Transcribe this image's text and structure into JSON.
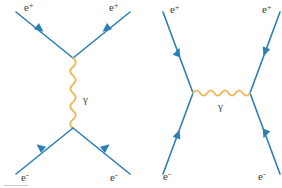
{
  "figure": {
    "background_color": "#ffffff",
    "width": 282,
    "height": 188
  },
  "colors": {
    "fermion_line": "#2b7fb8",
    "photon_line": "#edb95a",
    "label_text": "#3b3b3b",
    "frame_line": "#c9c9c9"
  },
  "diagrams": [
    {
      "name": "annihilation-diagram",
      "channel": "s-channel",
      "description": "Electron-positron annihilation into a virtual photon",
      "labels": {
        "top_left": {
          "base": "e",
          "sup": "+"
        },
        "top_right": {
          "base": "e",
          "sup": "+"
        },
        "bottom_left": {
          "base": "e",
          "sup": "-"
        },
        "bottom_right": {
          "base": "e",
          "sup": "-"
        },
        "mediator": "γ"
      }
    },
    {
      "name": "scattering-diagram",
      "channel": "t-channel",
      "description": "Bhabha scattering via photon exchange",
      "labels": {
        "top_left": {
          "base": "e",
          "sup": "+"
        },
        "top_right": {
          "base": "e",
          "sup": "+"
        },
        "bottom_left": {
          "base": "e",
          "sup": "-"
        },
        "bottom_right": {
          "base": "e",
          "sup": "-"
        },
        "mediator": "γ"
      }
    }
  ]
}
